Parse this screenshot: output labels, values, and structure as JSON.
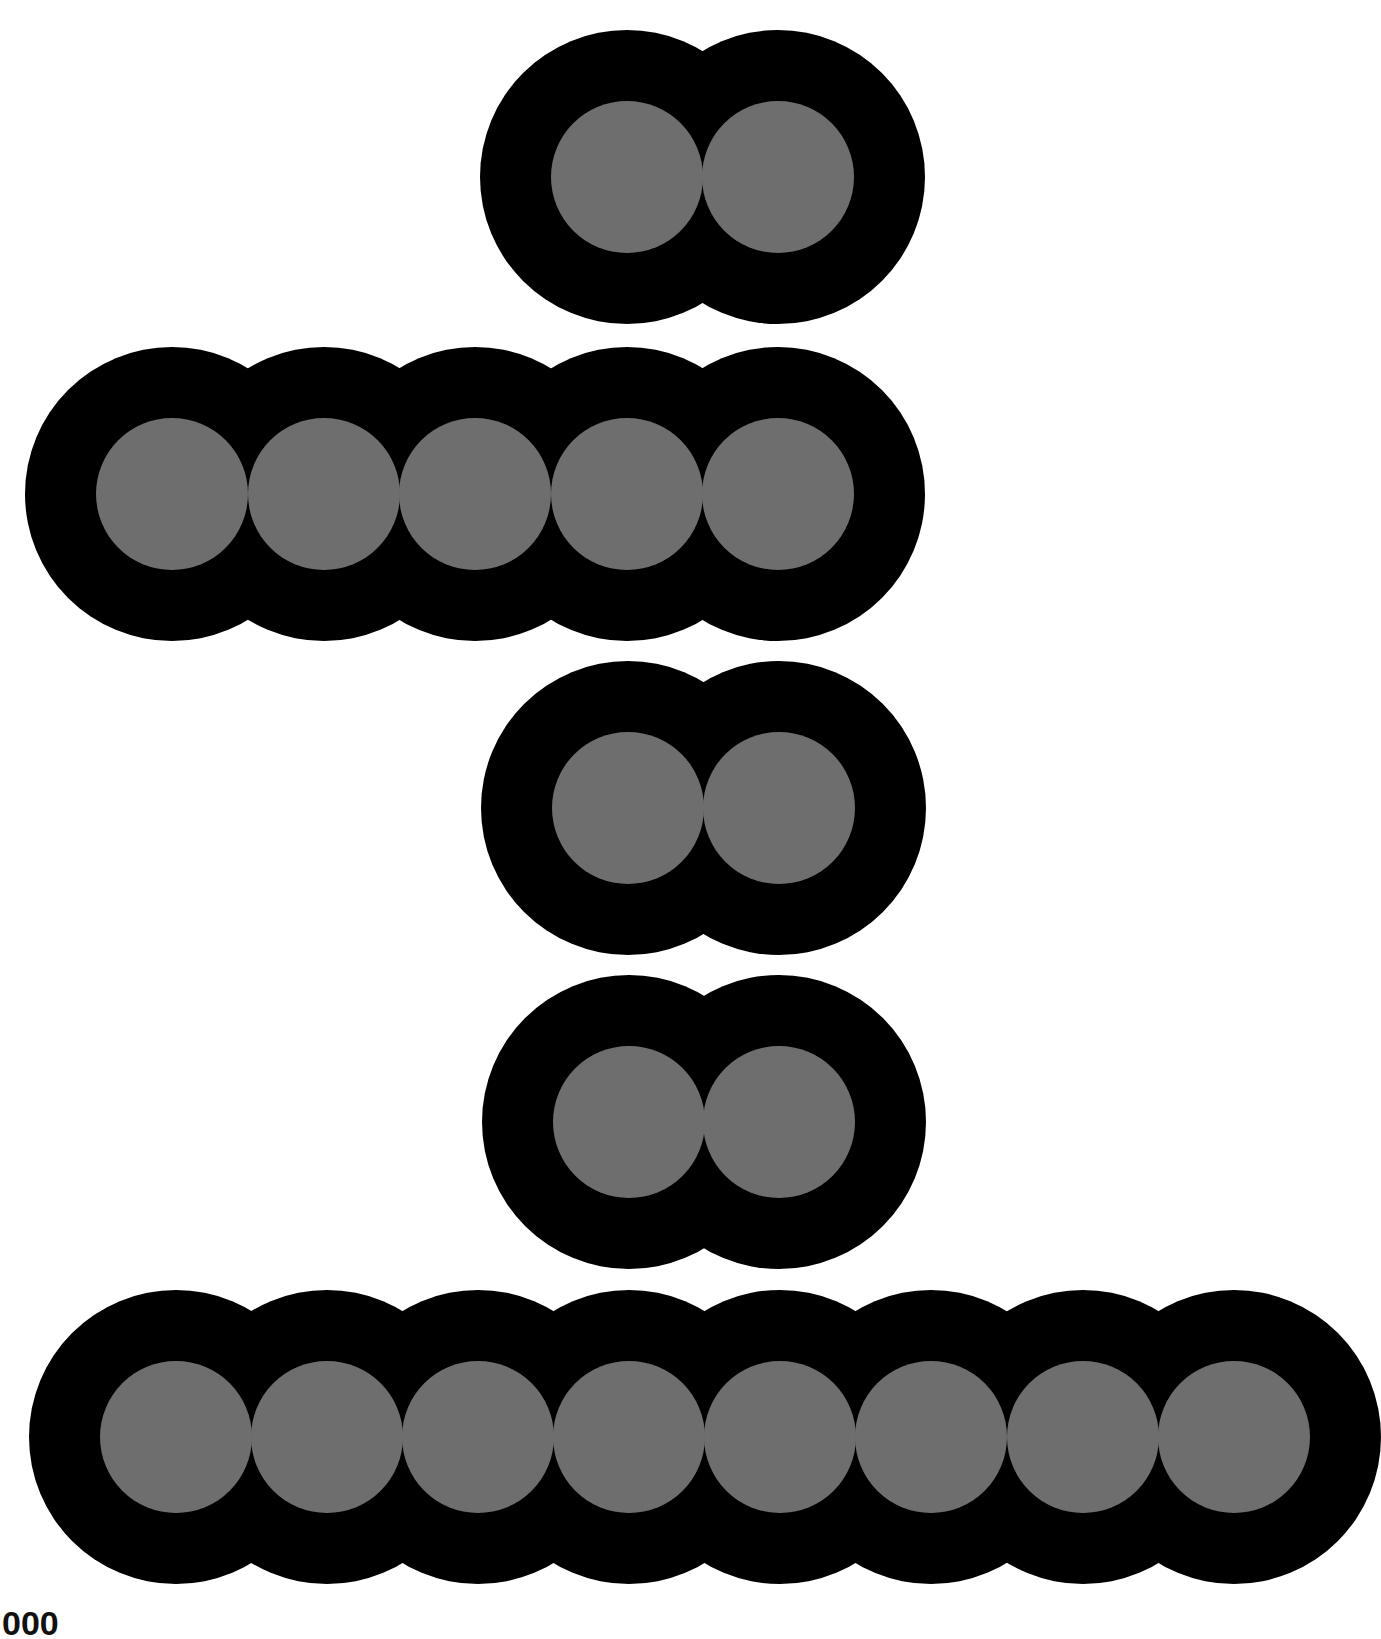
{
  "figure": {
    "background": "#ffffff",
    "outer_color": "#000000",
    "inner_color": "#6e6e6e",
    "outer_radius": 147,
    "inner_radius": 76,
    "rows": [
      {
        "name": "row-1",
        "count": 2,
        "cy": 177,
        "cx": [
          627,
          778
        ]
      },
      {
        "name": "row-2",
        "count": 5,
        "cy": 494,
        "cx": [
          172,
          324,
          475,
          627,
          778
        ]
      },
      {
        "name": "row-3",
        "count": 2,
        "cy": 808,
        "cx": [
          628,
          779
        ]
      },
      {
        "name": "row-4",
        "count": 2,
        "cy": 1122,
        "cx": [
          629,
          779
        ]
      },
      {
        "name": "row-5",
        "count": 8,
        "cy": 1437,
        "cx": [
          176,
          327,
          478,
          629,
          780,
          931,
          1083,
          1234
        ]
      }
    ]
  },
  "caption": {
    "text": "000"
  }
}
